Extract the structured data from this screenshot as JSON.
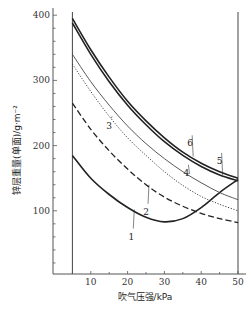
{
  "chart_data": {
    "type": "line",
    "title": "",
    "xlabel": "吹气压强/kPa",
    "ylabel": "锌层重量(单面)/g·m⁻²",
    "xlim": [
      0,
      52
    ],
    "ylim": [
      0,
      420
    ],
    "xticks": [
      10,
      20,
      30,
      40,
      50
    ],
    "yticks": [
      100,
      200,
      300,
      400
    ],
    "grid": false,
    "legend": "inline numeric labels on curves",
    "reference_lines": [
      {
        "x": 5
      },
      {
        "x": 50
      }
    ],
    "series": [
      {
        "name": "1",
        "style": "solid-thick",
        "x": [
          5,
          10,
          15,
          20,
          25,
          30,
          35,
          40,
          45,
          50
        ],
        "y": [
          185,
          150,
          125,
          105,
          90,
          83,
          88,
          105,
          128,
          148
        ]
      },
      {
        "name": "2",
        "style": "dashed",
        "x": [
          5,
          10,
          15,
          20,
          25,
          30,
          35,
          40,
          45,
          50
        ],
        "y": [
          265,
          225,
          192,
          164,
          140,
          121,
          107,
          96,
          88,
          82
        ]
      },
      {
        "name": "3",
        "style": "dotted",
        "x": [
          5,
          10,
          15,
          20,
          25,
          30,
          35,
          40,
          45,
          50
        ],
        "y": [
          325,
          283,
          245,
          212,
          185,
          160,
          139,
          122,
          110,
          100
        ]
      },
      {
        "name": "4",
        "style": "solid-thin",
        "x": [
          5,
          10,
          15,
          20,
          25,
          30,
          35,
          40,
          45,
          50
        ],
        "y": [
          340,
          298,
          262,
          230,
          203,
          180,
          160,
          143,
          128,
          117
        ]
      },
      {
        "name": "5",
        "style": "solid-dashdot-thick",
        "x": [
          5,
          10,
          15,
          20,
          25,
          30,
          35,
          40,
          45,
          50
        ],
        "y": [
          388,
          340,
          298,
          262,
          232,
          206,
          185,
          168,
          155,
          146
        ]
      },
      {
        "name": "6",
        "style": "solid-thick",
        "x": [
          5,
          10,
          15,
          20,
          25,
          30,
          35,
          40,
          45,
          50
        ],
        "y": [
          395,
          347,
          305,
          268,
          238,
          212,
          190,
          173,
          160,
          150
        ]
      }
    ],
    "label_positions": {
      "1": {
        "x": 21,
        "y": 62
      },
      "2": {
        "x": 25,
        "y": 100
      },
      "3": {
        "x": 15,
        "y": 231
      },
      "4": {
        "x": 36,
        "y": 160
      },
      "5": {
        "x": 45,
        "y": 178
      },
      "6": {
        "x": 37,
        "y": 205
      }
    }
  },
  "axis": {
    "x_tick_labels": [
      "10",
      "20",
      "30",
      "40",
      "50"
    ],
    "y_tick_labels": [
      "100",
      "200",
      "300",
      "400"
    ]
  }
}
